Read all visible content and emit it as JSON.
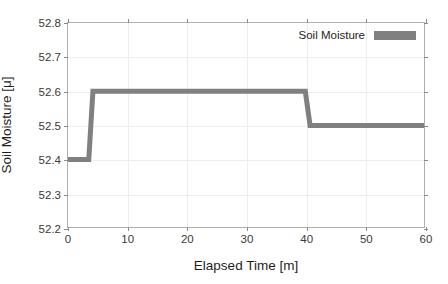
{
  "figure": {
    "title_remnant": "",
    "background_color": "#ffffff"
  },
  "chart_data": {
    "type": "line",
    "line_style": "step",
    "title": "",
    "xlabel": "Elapsed Time [m]",
    "ylabel": "Soil Moisture [μ]",
    "xlim": [
      0,
      60
    ],
    "ylim": [
      52.2,
      52.8
    ],
    "xticks": [
      0,
      10,
      20,
      30,
      40,
      50,
      60
    ],
    "yticks": [
      52.2,
      52.3,
      52.4,
      52.5,
      52.6,
      52.7,
      52.8
    ],
    "xtick_labels": [
      "0",
      "10",
      "20",
      "30",
      "40",
      "50",
      "60"
    ],
    "ytick_labels": [
      "52.2",
      "52.3",
      "52.4",
      "52.5",
      "52.6",
      "52.7",
      "52.8"
    ],
    "grid": true,
    "legend_position": "top-right",
    "series": [
      {
        "name": "Soil Moisture",
        "color": "#808080",
        "line_width": 5,
        "x": [
          0,
          3.5,
          4.2,
          40.0,
          40.8,
          60
        ],
        "values": [
          52.4,
          52.4,
          52.6,
          52.6,
          52.5,
          52.5
        ],
        "segments": [
          {
            "from_x": 0,
            "to_x": 3.5,
            "value": 52.4
          },
          {
            "from_x": 4.2,
            "to_x": 40.0,
            "value": 52.6
          },
          {
            "from_x": 40.8,
            "to_x": 60.0,
            "value": 52.5
          }
        ]
      }
    ]
  },
  "legend": {
    "entries": [
      {
        "label": "Soil Moisture",
        "color": "#808080"
      }
    ]
  },
  "colors": {
    "series": "#808080",
    "grid": "#ededf0",
    "axis": "#b0b0b0",
    "text": "#1e1e1e"
  }
}
